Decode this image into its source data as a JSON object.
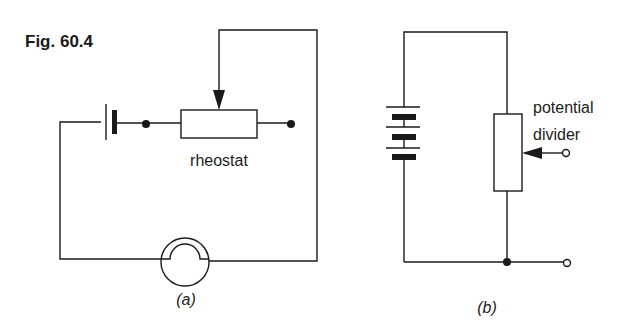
{
  "figure": {
    "title": "Fig. 60.4",
    "colors": {
      "ink": "#1a1a1a",
      "background": "#ffffff"
    }
  },
  "circuit_a": {
    "caption": "(a)",
    "components": [
      {
        "type": "cell",
        "label": ""
      },
      {
        "type": "rheostat",
        "label": "rheostat"
      },
      {
        "type": "lamp",
        "label": ""
      }
    ]
  },
  "circuit_b": {
    "caption": "(b)",
    "components": [
      {
        "type": "battery",
        "cells": 3,
        "label": ""
      },
      {
        "type": "potential-divider",
        "label_line1": "potential",
        "label_line2": "divider"
      },
      {
        "type": "output-terminals",
        "count": 2
      }
    ]
  }
}
